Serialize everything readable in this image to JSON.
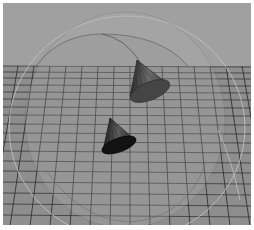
{
  "viewport": {
    "label": "3D perspective viewport",
    "background_color": "#9e9e9e",
    "ground_color": "#8f8f8f",
    "grid_line_color": "#2e2e2e",
    "horizon_y": 66
  },
  "scene": {
    "objects": [
      {
        "name": "sphere-dome",
        "type": "transparent-sphere",
        "color": "#a8a8a8"
      },
      {
        "name": "cone-upper",
        "type": "cone",
        "color": "#5a5a5a",
        "base_color": "#3f3f3f"
      },
      {
        "name": "cone-lower",
        "type": "cone",
        "color": "#4a4a4a",
        "base_color": "#141414"
      }
    ]
  }
}
